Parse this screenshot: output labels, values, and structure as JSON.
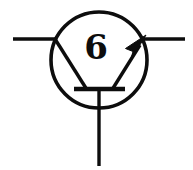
{
  "figure": {
    "kind": "circuit-symbol",
    "label": "6",
    "colors": {
      "ink": "#0d0d0d",
      "background": "#ffffff"
    },
    "canvas": {
      "width": 193,
      "height": 170
    },
    "envelope": {
      "name": "transistor-envelope-circle",
      "cx": 99,
      "cy": 60,
      "r": 48,
      "stroke_width": 3.6
    },
    "base_bar": {
      "name": "base-bar",
      "x1": 74,
      "y1": 89,
      "x2": 125,
      "y2": 89,
      "stroke_width": 4.2
    },
    "terminals": [
      {
        "name": "collector-lead",
        "x1": 13,
        "y1": 39,
        "x2": 55,
        "y2": 39,
        "stroke_width": 3.4
      },
      {
        "name": "emitter-lead",
        "x1": 145,
        "y1": 39,
        "x2": 185,
        "y2": 39,
        "stroke_width": 3.4
      },
      {
        "name": "base-lead",
        "x1": 99,
        "y1": 89,
        "x2": 99,
        "y2": 166,
        "stroke_width": 3.4
      }
    ],
    "internal_legs": [
      {
        "name": "collector-internal-leg",
        "x1": 55,
        "y1": 39,
        "x2": 86,
        "y2": 88,
        "stroke_width": 3.4
      },
      {
        "name": "emitter-internal-leg",
        "x1": 113,
        "y1": 88,
        "x2": 139,
        "y2": 46,
        "stroke_width": 3.4
      }
    ],
    "arrow": {
      "name": "emitter-arrow-head",
      "tip_x": 145,
      "tip_y": 37,
      "points": "145,36 126,49 133,51 131,59",
      "direction": "outward-up-right"
    },
    "label_position": {
      "x": 96,
      "y": 59
    }
  }
}
